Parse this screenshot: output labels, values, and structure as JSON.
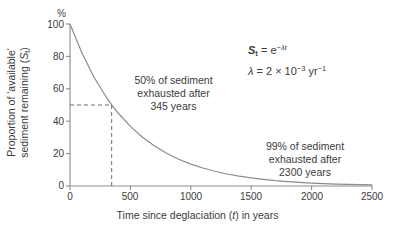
{
  "chart_data": {
    "type": "line",
    "title": "",
    "xlabel": "Time since deglaciation (t) in years",
    "ylabel_line1": "Proportion of 'available'",
    "ylabel_line2": "sediment remaining (St)",
    "yunit": "%",
    "xlim": [
      0,
      2500
    ],
    "ylim": [
      0,
      100
    ],
    "xticks": [
      "0",
      "500",
      "1000",
      "1500",
      "2000",
      "2500"
    ],
    "xtick_values": [
      0,
      500,
      1000,
      1500,
      2000,
      2500
    ],
    "yticks": [
      "0",
      "20",
      "40",
      "60",
      "80",
      "100"
    ],
    "ytick_values": [
      0,
      20,
      40,
      60,
      80,
      100
    ],
    "grid": false,
    "legend": "none",
    "series": [
      {
        "name": "Proportion of available sediment remaining",
        "formula": "S_t = 100 * exp(-0.002 * t)",
        "x": [
          0,
          100,
          200,
          300,
          345,
          400,
          500,
          600,
          700,
          800,
          900,
          1000,
          1100,
          1200,
          1300,
          1400,
          1500,
          1600,
          1700,
          1800,
          1900,
          2000,
          2100,
          2200,
          2300,
          2400,
          2500
        ],
        "y": [
          100.0,
          81.9,
          67.0,
          54.9,
          50.1,
          44.9,
          36.8,
          30.1,
          24.7,
          20.2,
          16.5,
          13.5,
          11.1,
          9.1,
          7.4,
          6.1,
          5.0,
          4.1,
          3.3,
          2.7,
          2.2,
          1.8,
          1.5,
          1.2,
          1.0,
          0.8,
          0.7
        ]
      }
    ],
    "markers": [
      {
        "name": "half-life",
        "x": 345,
        "y": 50,
        "style": "dashed-guides"
      }
    ]
  },
  "equation": {
    "line1_lhs": "S",
    "line1_lhs_sub": "t",
    "line1_eq": "= e",
    "line1_exp_minus": "−",
    "line1_exp_lambda": "λ",
    "line1_exp_t": "t",
    "line2_lambda": "λ",
    "line2_eq": "= 2 × 10",
    "line2_exp": "−3",
    "line2_unit": "yr",
    "line2_unit_exp": "−1"
  },
  "annotations": {
    "half": {
      "line1": "50% of sediment",
      "line2": "exhausted after",
      "line3": "345 years"
    },
    "ninetynine": {
      "line1": "99% of sediment",
      "line2": "exhausted after",
      "line3": "2300 years"
    }
  },
  "axis_titles": {
    "x": "Time since deglaciation (t) in years",
    "x_pre": "Time since deglaciation (",
    "x_italic": "t",
    "x_post": ") in years",
    "y_line1": "Proportion of 'available'",
    "y_line2_pre": "sediment remaining (",
    "y_line2_italic": "S",
    "y_line2_sub": "t",
    "y_line2_post": ")",
    "y_unit": "%"
  },
  "colors": {
    "curve": "#8c8c8c",
    "axis": "#8c8c8c",
    "text": "#3c3c3c",
    "dashed": "#6e6e6e",
    "background": "#ffffff"
  }
}
